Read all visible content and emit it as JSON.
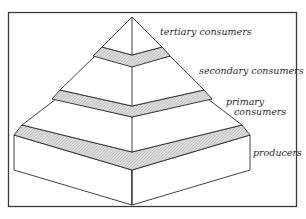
{
  "diagram": {
    "levels": [
      {
        "id": "tertiary",
        "label": "tertiary consumers"
      },
      {
        "id": "secondary",
        "label": "secondary consumers"
      },
      {
        "id": "primary",
        "label_line1": "primary",
        "label_line2": "consumers"
      },
      {
        "id": "producers",
        "label": "producers"
      }
    ],
    "colors": {
      "line": "#2b2b2b",
      "band_fill": "#d6d6d6",
      "face_fill": "#ffffff",
      "frame": "#3a3a3a"
    }
  }
}
